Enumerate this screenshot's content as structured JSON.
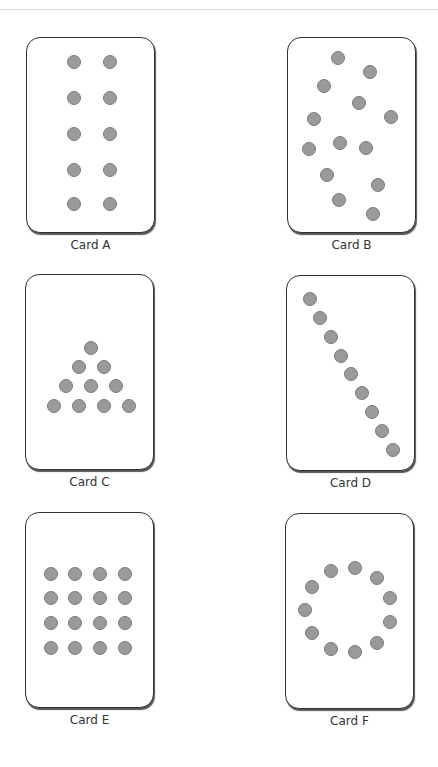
{
  "colors": {
    "dot": "#9a9a9a",
    "dot_border": "#7a7a7a",
    "card_border": "#333333"
  },
  "cards": [
    {
      "label": "Card A",
      "x": 26,
      "y": 37,
      "pattern": "two-columns",
      "dots": [
        [
          74,
          62
        ],
        [
          110,
          62
        ],
        [
          74,
          98
        ],
        [
          110,
          98
        ],
        [
          74,
          134
        ],
        [
          110,
          134
        ],
        [
          74,
          170
        ],
        [
          110,
          170
        ],
        [
          74,
          204
        ],
        [
          110,
          204
        ]
      ]
    },
    {
      "label": "Card B",
      "x": 287,
      "y": 37,
      "pattern": "scattered",
      "dots": [
        [
          338,
          58
        ],
        [
          370,
          72
        ],
        [
          324,
          86
        ],
        [
          359,
          103
        ],
        [
          391,
          117
        ],
        [
          314,
          119
        ],
        [
          340,
          143
        ],
        [
          366,
          148
        ],
        [
          309,
          149
        ],
        [
          327,
          175
        ],
        [
          378,
          185
        ],
        [
          339,
          200
        ],
        [
          373,
          214
        ]
      ]
    },
    {
      "label": "Card C",
      "x": 25,
      "y": 274,
      "pattern": "triangle",
      "dots": [
        [
          91,
          348
        ],
        [
          79,
          367
        ],
        [
          104,
          367
        ],
        [
          66,
          386
        ],
        [
          91,
          386
        ],
        [
          116,
          386
        ],
        [
          54,
          406
        ],
        [
          79,
          406
        ],
        [
          104,
          406
        ],
        [
          129,
          406
        ]
      ]
    },
    {
      "label": "Card D",
      "x": 286,
      "y": 275,
      "pattern": "diagonal-line",
      "dots": [
        [
          310,
          299
        ],
        [
          320,
          318
        ],
        [
          331,
          337
        ],
        [
          341,
          356
        ],
        [
          351,
          374
        ],
        [
          362,
          393
        ],
        [
          372,
          412
        ],
        [
          382,
          431
        ],
        [
          393,
          450
        ]
      ]
    },
    {
      "label": "Card E",
      "x": 25,
      "y": 512,
      "pattern": "grid-4x4",
      "dots": [
        [
          51,
          574
        ],
        [
          75,
          574
        ],
        [
          100,
          574
        ],
        [
          125,
          574
        ],
        [
          51,
          598
        ],
        [
          75,
          598
        ],
        [
          100,
          598
        ],
        [
          125,
          598
        ],
        [
          51,
          623
        ],
        [
          75,
          623
        ],
        [
          100,
          623
        ],
        [
          125,
          623
        ],
        [
          51,
          648
        ],
        [
          75,
          648
        ],
        [
          100,
          648
        ],
        [
          125,
          648
        ]
      ]
    },
    {
      "label": "Card F",
      "x": 285,
      "y": 513,
      "pattern": "circle",
      "dots": [
        [
          355,
          568
        ],
        [
          331,
          571
        ],
        [
          377,
          578
        ],
        [
          312,
          587
        ],
        [
          390,
          598
        ],
        [
          305,
          610
        ],
        [
          390,
          622
        ],
        [
          312,
          633
        ],
        [
          377,
          643
        ],
        [
          331,
          649
        ],
        [
          355,
          652
        ]
      ]
    }
  ]
}
